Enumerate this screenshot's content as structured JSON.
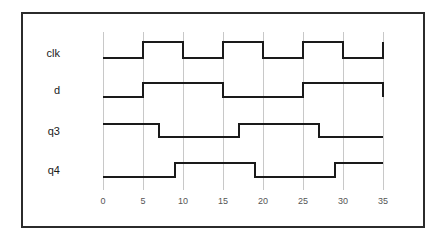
{
  "figure": {
    "kind": "digital-timing-diagram",
    "border_color": "#2b2b2b",
    "background": "#ffffff",
    "grid_color": "#c8c8c8",
    "wave_color": "#1a1a1a"
  },
  "axis": {
    "tick_labels": [
      "0",
      "5",
      "10",
      "15",
      "20",
      "25",
      "30",
      "35"
    ],
    "tick_values": [
      0,
      5,
      10,
      15,
      20,
      25,
      30,
      35
    ],
    "xmin": 0,
    "xmax": 35,
    "grid": true
  },
  "signals": [
    {
      "name": "clk",
      "label": "clk"
    },
    {
      "name": "d",
      "label": "d"
    },
    {
      "name": "q3",
      "label": "q3"
    },
    {
      "name": "q4",
      "label": "q4"
    }
  ],
  "chart_data": {
    "type": "line",
    "title": "",
    "xlabel": "",
    "ylabel": "",
    "xlim": [
      0,
      35
    ],
    "grid": true,
    "legend_position": "left-labels",
    "categories": [
      "clk",
      "d",
      "q3",
      "q4"
    ],
    "series": [
      {
        "name": "clk",
        "transitions": [
          {
            "t": 0,
            "level": 0
          },
          {
            "t": 5,
            "level": 1
          },
          {
            "t": 10,
            "level": 0
          },
          {
            "t": 15,
            "level": 1
          },
          {
            "t": 20,
            "level": 0
          },
          {
            "t": 25,
            "level": 1
          },
          {
            "t": 30,
            "level": 0
          },
          {
            "t": 35,
            "level": 1
          }
        ]
      },
      {
        "name": "d",
        "transitions": [
          {
            "t": 0,
            "level": 0
          },
          {
            "t": 5,
            "level": 1
          },
          {
            "t": 15,
            "level": 0
          },
          {
            "t": 25,
            "level": 1
          },
          {
            "t": 35,
            "level": 0
          }
        ]
      },
      {
        "name": "q3",
        "transitions": [
          {
            "t": 0,
            "level": 1
          },
          {
            "t": 7,
            "level": 0
          },
          {
            "t": 17,
            "level": 1
          },
          {
            "t": 27,
            "level": 0
          },
          {
            "t": 35,
            "level": 0
          }
        ]
      },
      {
        "name": "q4",
        "transitions": [
          {
            "t": 0,
            "level": 0
          },
          {
            "t": 9,
            "level": 1
          },
          {
            "t": 19,
            "level": 0
          },
          {
            "t": 29,
            "level": 1
          },
          {
            "t": 35,
            "level": 1
          }
        ]
      }
    ]
  }
}
